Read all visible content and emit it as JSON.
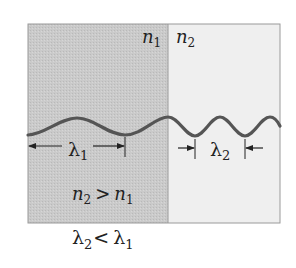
{
  "diagram": {
    "colors": {
      "medium1_fill": "#c8c8c8",
      "medium2_fill": "#efefef",
      "border": "#9a9a9a",
      "wave": "#555555",
      "text": "#222222"
    },
    "media": [
      {
        "id": "medium1",
        "label_base": "n",
        "label_sub": "1",
        "position": "left"
      },
      {
        "id": "medium2",
        "label_base": "n",
        "label_sub": "2",
        "position": "right"
      }
    ],
    "wavelengths": {
      "lambda1": {
        "base": "λ",
        "sub": "1",
        "span_px": 96
      },
      "lambda2": {
        "base": "λ",
        "sub": "2",
        "span_px": 50
      }
    },
    "condition": {
      "left_base": "n",
      "left_sub": "2",
      "op": ">",
      "right_base": "n",
      "right_sub": "1"
    },
    "result": {
      "left_base": "λ",
      "left_sub": "2",
      "op": "<",
      "right_base": "λ",
      "right_sub": "1"
    }
  }
}
